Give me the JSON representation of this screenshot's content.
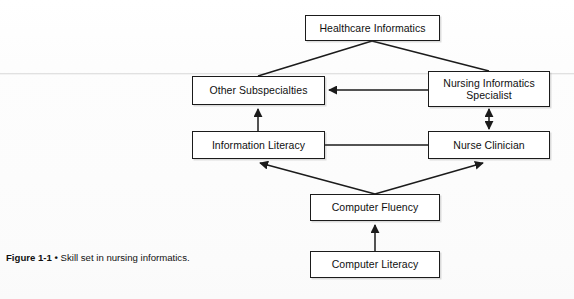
{
  "figure": {
    "caption_label": "Figure 1-1",
    "caption_bullet": "•",
    "caption_text": "Skill set in nursing informatics.",
    "ink_color": "#1b1b1b",
    "paper_color": "#fdfdfd"
  },
  "diagram": {
    "type": "hierarchy-flow",
    "nodes": [
      {
        "id": "healthcare-informatics",
        "label": "Healthcare Informatics",
        "x": 305,
        "y": 15,
        "w": 135,
        "h": 26
      },
      {
        "id": "other-subspecialties",
        "label": "Other Subspecialties",
        "x": 192,
        "y": 76,
        "w": 133,
        "h": 29
      },
      {
        "id": "nursing-informatics-specialist",
        "label": "Nursing Informatics\nSpecialist",
        "x": 428,
        "y": 71,
        "w": 122,
        "h": 36
      },
      {
        "id": "information-literacy",
        "label": "Information Literacy",
        "x": 192,
        "y": 131,
        "w": 133,
        "h": 28
      },
      {
        "id": "nurse-clinician",
        "label": "Nurse Clinician",
        "x": 428,
        "y": 131,
        "w": 122,
        "h": 28
      },
      {
        "id": "computer-fluency",
        "label": "Computer Fluency",
        "x": 310,
        "y": 194,
        "w": 130,
        "h": 27
      },
      {
        "id": "computer-literacy",
        "label": "Computer Literacy",
        "x": 310,
        "y": 251,
        "w": 130,
        "h": 27
      }
    ],
    "edges": [
      {
        "id": "hi-to-other",
        "from": "healthcare-informatics",
        "to": "other-subspecialties",
        "arrow": "none",
        "style": "diagonal"
      },
      {
        "id": "hi-to-nis",
        "from": "healthcare-informatics",
        "to": "nursing-informatics-specialist",
        "arrow": "none",
        "style": "diagonal"
      },
      {
        "id": "nis-to-other",
        "from": "nursing-informatics-specialist",
        "to": "other-subspecialties",
        "arrow": "single",
        "style": "horizontal"
      },
      {
        "id": "infolit-to-other",
        "from": "information-literacy",
        "to": "other-subspecialties",
        "arrow": "single",
        "style": "vertical"
      },
      {
        "id": "nis-nurse-clinician",
        "from": "nursing-informatics-specialist",
        "to": "nurse-clinician",
        "arrow": "double",
        "style": "vertical"
      },
      {
        "id": "infolit-nurse-clinician",
        "from": "information-literacy",
        "to": "nurse-clinician",
        "arrow": "none",
        "style": "horizontal"
      },
      {
        "id": "fluency-to-infolit",
        "from": "computer-fluency",
        "to": "information-literacy",
        "arrow": "single",
        "style": "diagonal"
      },
      {
        "id": "fluency-to-nurse-clinician",
        "from": "computer-fluency",
        "to": "nurse-clinician",
        "arrow": "single",
        "style": "diagonal"
      },
      {
        "id": "literacy-to-fluency",
        "from": "computer-literacy",
        "to": "computer-fluency",
        "arrow": "single",
        "style": "vertical"
      }
    ]
  }
}
